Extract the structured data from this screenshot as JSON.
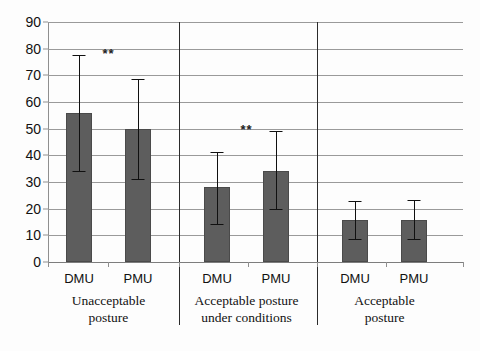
{
  "chart_data": {
    "type": "bar",
    "title": "",
    "xlabel": "",
    "ylabel": "",
    "ylim": [
      0,
      90
    ],
    "ytick_step": 10,
    "yticks": [
      0,
      10,
      20,
      30,
      40,
      50,
      60,
      70,
      80,
      90
    ],
    "grid": true,
    "legend": "none",
    "bar_color": "#5d5d5d",
    "error_color": "#101010",
    "categories": [
      "DMU",
      "PMU",
      "DMU",
      "PMU",
      "DMU",
      "PMU"
    ],
    "groups": [
      {
        "label_line1": "Unacceptable",
        "label_line2": "posture",
        "significance": "**",
        "bars": [
          {
            "category": "DMU",
            "value": 55.8,
            "err_low": 34.0,
            "err_high": 77.6
          },
          {
            "category": "PMU",
            "value": 49.8,
            "err_low": 31.0,
            "err_high": 68.8
          }
        ]
      },
      {
        "label_line1": "Acceptable posture",
        "label_line2": "under conditions",
        "significance": "**",
        "bars": [
          {
            "category": "DMU",
            "value": 28.0,
            "err_low": 14.2,
            "err_high": 41.2
          },
          {
            "category": "PMU",
            "value": 34.2,
            "err_low": 19.8,
            "err_high": 49.2
          }
        ]
      },
      {
        "label_line1": "Acceptable",
        "label_line2": "posture",
        "significance": "",
        "bars": [
          {
            "category": "DMU",
            "value": 15.8,
            "err_low": 8.8,
            "err_high": 23.0
          },
          {
            "category": "PMU",
            "value": 15.8,
            "err_low": 8.8,
            "err_high": 23.2
          }
        ]
      }
    ],
    "series": [
      {
        "name": "percentage",
        "values": [
          55.8,
          49.8,
          28.0,
          34.2,
          15.8,
          15.8
        ],
        "err_low": [
          34.0,
          31.0,
          14.2,
          19.8,
          8.8,
          8.8
        ],
        "err_high": [
          77.6,
          68.8,
          41.2,
          49.2,
          23.0,
          23.2
        ]
      }
    ],
    "annotations": [
      {
        "text": "**",
        "group": 0
      },
      {
        "text": "**",
        "group": 1
      }
    ]
  }
}
